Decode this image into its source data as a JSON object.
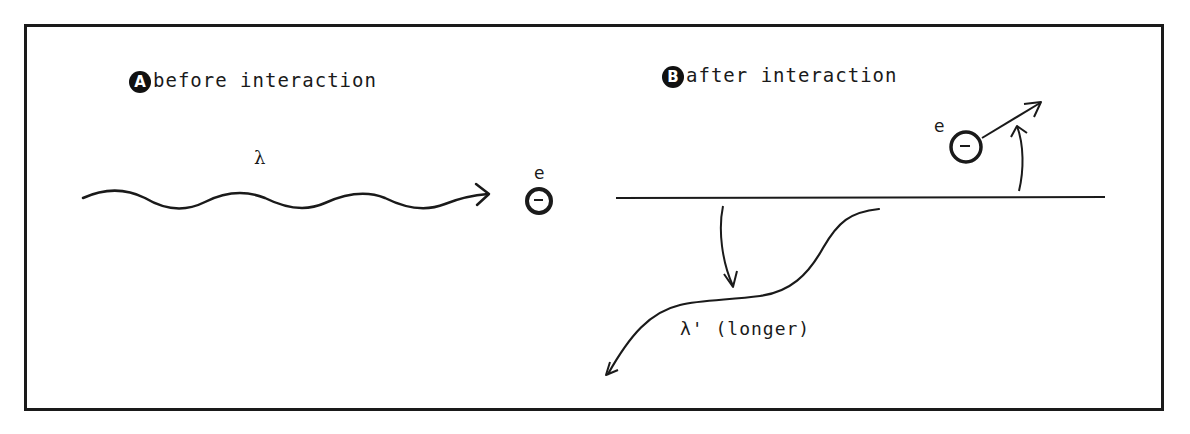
{
  "panel_a": {
    "badge": "A",
    "title": "before interaction",
    "wave_label": "λ",
    "electron_label": "e",
    "electron_charge": "−"
  },
  "panel_b": {
    "badge": "B",
    "title": "after interaction",
    "scattered_wave_label": "λ' (longer)",
    "electron_label": "e",
    "electron_charge": "−"
  },
  "colors": {
    "stroke": "#1a1a1a",
    "background": "#ffffff"
  }
}
